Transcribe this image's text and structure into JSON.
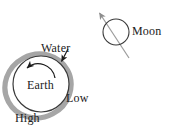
{
  "figure": {
    "kind": "tide-diagram",
    "background_color": "#ffffff",
    "ink_color": "#222222",
    "water_color": "#a8a8a8",
    "moon_line_color": "#9a9a9a"
  },
  "labels": {
    "water": "Water",
    "earth": "Earth",
    "low": "Low",
    "high": "High",
    "moon": "Moon"
  },
  "icons": {
    "water_pointer": "arrow-pointing-to-water-layer",
    "earth_rotation": "counterclockwise-rotation-arrow",
    "moon_direction": "moon-orbit-direction-arrow",
    "earth_body": "earth-circle",
    "water_shell": "water-bulge-ellipse",
    "moon_body": "moon-circle"
  },
  "geometry": {
    "earth_circle": {
      "cx": 41,
      "cy": 84,
      "r": 28
    },
    "water_ellipse": {
      "cx": 38,
      "cy": 86,
      "rx": 33,
      "ry": 31,
      "rotation_deg": -28
    },
    "moon_circle": {
      "cx": 116,
      "cy": 32,
      "r": 13
    },
    "moon_arrow": {
      "x1": 129,
      "y1": 58,
      "x2": 98,
      "y2": 11
    },
    "water_pointer_arrow": {
      "x1": 69,
      "y1": 49,
      "x2": 61,
      "y2": 62
    }
  }
}
